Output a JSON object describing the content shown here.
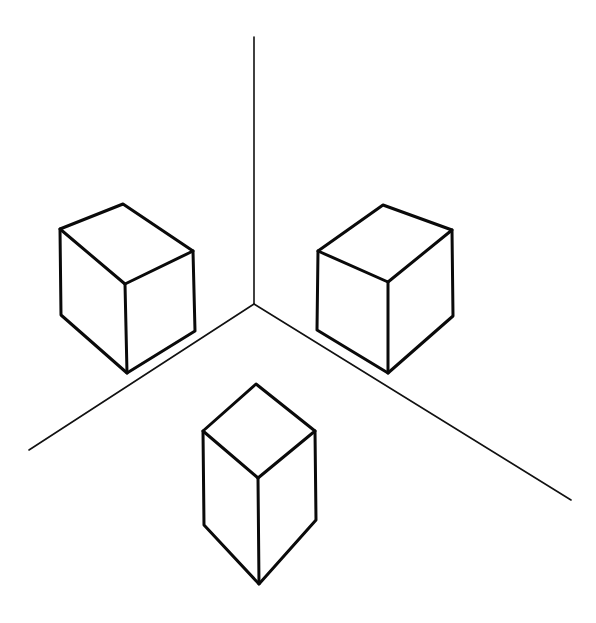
{
  "figure": {
    "background": "#ffffff",
    "line_color": "#0a0a0a",
    "axes": {
      "origin": [
        254,
        304
      ],
      "vertical_top": [
        254,
        37
      ],
      "left_end": [
        29,
        450
      ],
      "right_end": [
        571,
        500
      ]
    },
    "shapes": [
      {
        "name": "left-cube",
        "label": "cube on left wall"
      },
      {
        "name": "right-cube",
        "label": "cube on right wall"
      },
      {
        "name": "bottom-prism",
        "label": "tall prism on floor"
      }
    ]
  }
}
